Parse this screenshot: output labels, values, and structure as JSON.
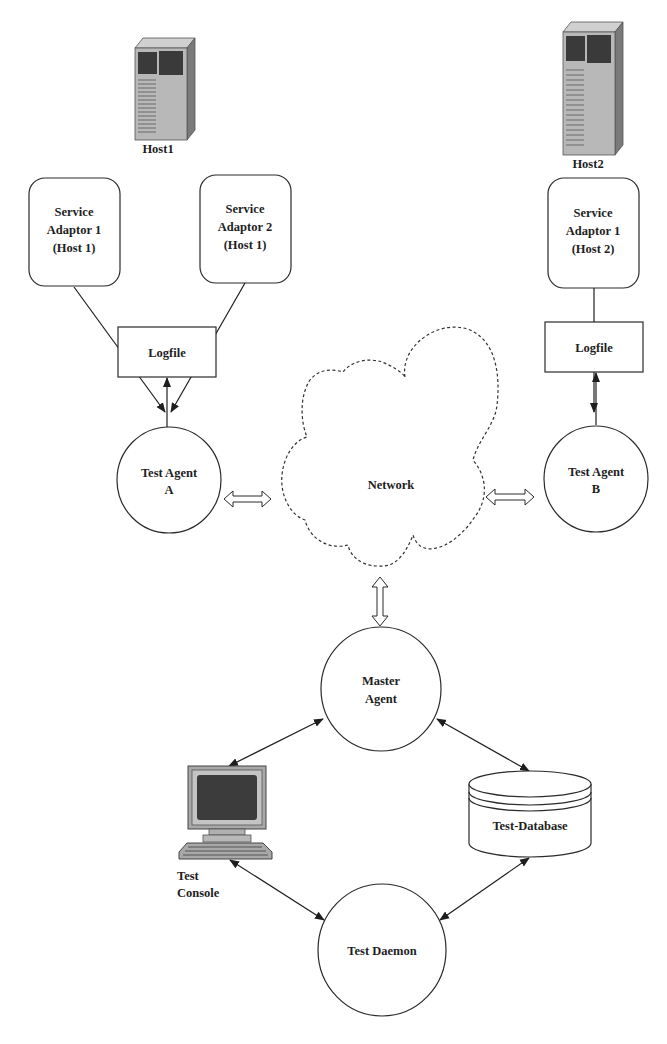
{
  "hosts": [
    {
      "id": "host1",
      "label": "Host1"
    },
    {
      "id": "host2",
      "label": "Host2"
    }
  ],
  "service_adaptors": [
    {
      "id": "sa1_h1",
      "lines": [
        "Service",
        "Adaptor 1",
        "(Host 1)"
      ]
    },
    {
      "id": "sa2_h1",
      "lines": [
        "Service",
        "Adaptor 2",
        "(Host 1)"
      ]
    },
    {
      "id": "sa1_h2",
      "lines": [
        "Service",
        "Adaptor 1",
        "(Host 2)"
      ]
    }
  ],
  "logfiles": [
    {
      "id": "logfile_a",
      "label": "Logfile"
    },
    {
      "id": "logfile_b",
      "label": "Logfile"
    }
  ],
  "agents": {
    "test_agent_a": {
      "lines": [
        "Test Agent",
        "A"
      ]
    },
    "test_agent_b": {
      "lines": [
        "Test Agent",
        "B"
      ]
    },
    "master_agent": {
      "lines": [
        "Master",
        "Agent"
      ]
    },
    "test_daemon": {
      "label": "Test Daemon"
    }
  },
  "network": {
    "label": "Network"
  },
  "console": {
    "lines": [
      "Test",
      "Console"
    ]
  },
  "database": {
    "label": "Test-Database"
  },
  "colors": {
    "stroke": "#2a2a2a",
    "server_body": "#b8b8b8",
    "server_side": "#7a7a7a",
    "server_panel": "#3a3a3a",
    "monitor_frame": "#a8a8a8",
    "monitor_screen": "#3c3c3c"
  }
}
